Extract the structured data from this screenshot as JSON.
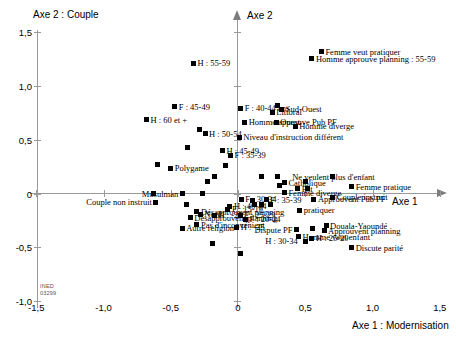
{
  "chart_data": {
    "type": "scatter",
    "title": "Axe 2 : Couple",
    "xlabel": "Axe 1 : Modernisation",
    "ylabel": "Axe 2 : Couple",
    "x_axis_name": "Axe 1",
    "y_axis_name": "Axe 2",
    "xlim": [
      -1.5,
      1.5
    ],
    "ylim": [
      -1.0,
      1.5
    ],
    "xticks": [
      "-1,5",
      "-1,0",
      "-0,5",
      "0",
      "0,5",
      "1,0",
      "1,5"
    ],
    "xtick_values": [
      -1.5,
      -1.0,
      -0.5,
      0,
      0.5,
      1.0,
      1.5
    ],
    "yticks": [
      "1,5",
      "1,0",
      "0,5",
      "0",
      "-0,5",
      "-1,0"
    ],
    "ytick_values": [
      1.5,
      1.0,
      0.5,
      0,
      -0.5,
      -1.0
    ],
    "grid": false,
    "legend": "none",
    "watermark": "INED\n03299",
    "points": [
      {
        "label": "H : 55-59",
        "x": -0.33,
        "y": 1.21,
        "side": "right"
      },
      {
        "label": "Femme veut pratiquer",
        "x": 0.62,
        "y": 1.32,
        "side": "right"
      },
      {
        "label": "Homme approuve planning : 55-59",
        "x": 0.55,
        "y": 1.255,
        "side": "right"
      },
      {
        "label": "F : 45-49",
        "x": -0.47,
        "y": 0.805,
        "side": "right"
      },
      {
        "label": "F : 40-44 ans",
        "x": 0.02,
        "y": 0.795,
        "side": "right"
      },
      {
        "label": "H : 60 et +",
        "x": -0.68,
        "y": 0.685,
        "side": "right"
      },
      {
        "label": "Sud-Ouest",
        "x": 0.325,
        "y": 0.785,
        "side": "right"
      },
      {
        "label": "Littoral",
        "x": 0.255,
        "y": 0.755,
        "side": "right"
      },
      {
        "label": "",
        "x": 0.295,
        "y": 0.815,
        "side": "right"
      },
      {
        "label": "Homme approuve Pub PF",
        "x": 0.05,
        "y": 0.665,
        "side": "right"
      },
      {
        "label": "Ouest",
        "x": 0.285,
        "y": 0.665,
        "side": "right"
      },
      {
        "label": "Homme diverge",
        "x": 0.425,
        "y": 0.625,
        "side": "right"
      },
      {
        "label": "H : 50-54",
        "x": -0.245,
        "y": 0.555,
        "side": "right"
      },
      {
        "label": "",
        "x": -0.285,
        "y": 0.6,
        "side": "right"
      },
      {
        "label": "Niveau d'instruction différent",
        "x": 0.01,
        "y": 0.525,
        "side": "right"
      },
      {
        "label": "H : 45-49",
        "x": -0.115,
        "y": 0.4,
        "side": "right"
      },
      {
        "label": "F : 35-39",
        "x": -0.055,
        "y": 0.355,
        "side": "right"
      },
      {
        "label": "",
        "x": -0.375,
        "y": 0.425,
        "side": "right"
      },
      {
        "label": "Polygame",
        "x": -0.5,
        "y": 0.235,
        "side": "right"
      },
      {
        "label": "",
        "x": -0.6,
        "y": 0.27,
        "side": "right"
      },
      {
        "label": "",
        "x": -0.095,
        "y": 0.26,
        "side": "right"
      },
      {
        "label": "",
        "x": -0.175,
        "y": 0.155,
        "side": "right"
      },
      {
        "label": "",
        "x": -0.225,
        "y": 0.115,
        "side": "right"
      },
      {
        "label": "",
        "x": 0.175,
        "y": 0.155,
        "side": "right"
      },
      {
        "label": "",
        "x": 0.29,
        "y": 0.16,
        "side": "right"
      },
      {
        "label": "",
        "x": 0.31,
        "y": 0.075,
        "side": "right"
      },
      {
        "label": "",
        "x": 0.5,
        "y": 0.115,
        "side": "right"
      },
      {
        "label": "Catholique",
        "x": 0.345,
        "y": 0.1,
        "side": "right"
      },
      {
        "label": "Ne veulent plus d'enfant",
        "x": 0.7,
        "y": 0.155,
        "side": "none"
      },
      {
        "label": "Est",
        "x": 0.445,
        "y": 0.045,
        "side": "right"
      },
      {
        "label": "Femme pratique",
        "x": 0.845,
        "y": 0.065,
        "side": "right"
      },
      {
        "label": "",
        "x": 0.52,
        "y": 0.05,
        "side": "right"
      },
      {
        "label": "Femme diverge",
        "x": 0.345,
        "y": 0.005,
        "side": "right"
      },
      {
        "label": "Musulman",
        "x": -0.415,
        "y": 0.0,
        "side": "left"
      },
      {
        "label": "",
        "x": -0.63,
        "y": 0.0,
        "side": "right"
      },
      {
        "label": "",
        "x": -0.265,
        "y": 0.0,
        "side": "right"
      },
      {
        "label": "Couple instruit",
        "x": 0.705,
        "y": -0.035,
        "side": "right"
      },
      {
        "label": "Approuvent Pub PF",
        "x": 0.565,
        "y": -0.055,
        "side": "right"
      },
      {
        "label": "F : 30-34",
        "x": 0.025,
        "y": -0.055,
        "side": "right"
      },
      {
        "label": "F : 35-39",
        "x": 0.21,
        "y": -0.06,
        "side": "right"
      },
      {
        "label": "",
        "x": 0.11,
        "y": -0.065,
        "side": "right"
      },
      {
        "label": "Couple non instruit",
        "x": -0.61,
        "y": -0.08,
        "side": "left"
      },
      {
        "label": "",
        "x": 0.125,
        "y": -0.105,
        "side": "right"
      },
      {
        "label": "",
        "x": 0.175,
        "y": -0.105,
        "side": "right"
      },
      {
        "label": "",
        "x": 0.245,
        "y": -0.105,
        "side": "right"
      },
      {
        "label": "H : 40-44",
        "x": -0.06,
        "y": -0.12,
        "side": "right"
      },
      {
        "label": "F : 15-19",
        "x": -0.075,
        "y": -0.145,
        "side": "right"
      },
      {
        "label": "",
        "x": -0.385,
        "y": -0.105,
        "side": "right"
      },
      {
        "label": "Désapprouvent planning",
        "x": -0.305,
        "y": -0.17,
        "side": "right"
      },
      {
        "label": "Nord",
        "x": -0.28,
        "y": -0.195,
        "side": "right"
      },
      {
        "label": "H : -25",
        "x": -0.175,
        "y": -0.2,
        "side": "right"
      },
      {
        "label": "Désapprouvent planning",
        "x": -0.355,
        "y": -0.225,
        "side": "right"
      },
      {
        "label": "F : 25-29",
        "x": 0.015,
        "y": -0.2,
        "side": "right"
      },
      {
        "label": "F : 20-24",
        "x": 0.055,
        "y": -0.24,
        "side": "right"
      },
      {
        "label": "pratiquer",
        "x": 0.46,
        "y": -0.155,
        "side": "right"
      },
      {
        "label": "Pas d'inconvénient",
        "x": -0.305,
        "y": -0.29,
        "side": "right"
      },
      {
        "label": "Autre religion",
        "x": -0.415,
        "y": -0.325,
        "side": "right"
      },
      {
        "label": "H : -25",
        "x": -0.01,
        "y": -0.315,
        "side": "right"
      },
      {
        "label": "Dispute PF",
        "x": 0.435,
        "y": -0.335,
        "side": "left"
      },
      {
        "label": "",
        "x": 0.555,
        "y": -0.325,
        "side": "right"
      },
      {
        "label": "Douala-Yaoundé",
        "x": 0.655,
        "y": -0.3,
        "side": "right"
      },
      {
        "label": "Approuvent planning",
        "x": 0.64,
        "y": -0.345,
        "side": "right"
      },
      {
        "label": "H : 25-29",
        "x": 0.55,
        "y": -0.415,
        "side": "right"
      },
      {
        "label": "H : 30-34",
        "x": 0.5,
        "y": -0.445,
        "side": "none"
      },
      {
        "label": "Homme veut enfant",
        "x": 0.45,
        "y": -0.4,
        "side": "right"
      },
      {
        "label": "",
        "x": -0.19,
        "y": -0.465,
        "side": "right"
      },
      {
        "label": "Discute parité",
        "x": 0.845,
        "y": -0.505,
        "side": "right"
      },
      {
        "label": "",
        "x": 0.015,
        "y": -0.555,
        "side": "right"
      }
    ]
  }
}
